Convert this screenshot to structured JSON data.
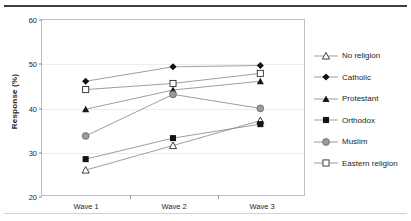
{
  "chart_data": {
    "type": "line",
    "title": "",
    "xlabel": "",
    "ylabel": "Response (%)",
    "categories": [
      "Wave 1",
      "Wave 2",
      "Wave 3"
    ],
    "ylim": [
      20,
      60
    ],
    "yticks": [
      20,
      30,
      40,
      50,
      60
    ],
    "ytick_labels": [
      "20",
      "30",
      "40",
      "50",
      "60"
    ],
    "grid": true,
    "legend_position": "right",
    "series": [
      {
        "name": "No religion",
        "marker": "open-triangle",
        "color": "#2b2b2b",
        "values": [
          25.7,
          31.3,
          37.0
        ]
      },
      {
        "name": "Catholic",
        "marker": "filled-diamond",
        "color": "#111111",
        "values": [
          46.0,
          49.3,
          49.6
        ]
      },
      {
        "name": "Protestant",
        "marker": "filled-triangle",
        "color": "#1a1a1a",
        "values": [
          39.6,
          44.0,
          46.0
        ]
      },
      {
        "name": "Orthodox",
        "marker": "filled-square",
        "color": "#141414",
        "values": [
          28.2,
          33.0,
          36.2
        ]
      },
      {
        "name": "Muslim",
        "marker": "gray-circle",
        "color": "#9b9b9b",
        "values": [
          33.5,
          43.0,
          39.8
        ]
      },
      {
        "name": "Eastern religion",
        "marker": "open-square",
        "color": "#2b2b2b",
        "values": [
          44.1,
          45.5,
          47.8
        ]
      }
    ]
  },
  "axis": {
    "y_title": "Response (%)"
  },
  "legend": {
    "items": [
      {
        "label": "No religion"
      },
      {
        "label": "Catholic"
      },
      {
        "label": "Protestant"
      },
      {
        "label": "Orthodox"
      },
      {
        "label": "Muslim"
      },
      {
        "label": "Eastern religion"
      }
    ]
  },
  "colors": {
    "line": "#8c8c8c",
    "frame": "#bfbfbf",
    "grid": "#ededed",
    "text": "#231f20",
    "rule_top": "#3f3f3f",
    "rule_bottom": "#d2d2d2"
  }
}
